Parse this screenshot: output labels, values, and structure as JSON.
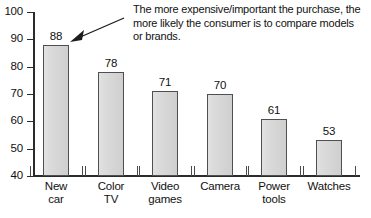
{
  "chart_data": {
    "type": "bar",
    "title": "",
    "subtitle": "",
    "xlabel": "",
    "ylabel": "",
    "ylim": [
      40,
      100
    ],
    "yticks": [
      40,
      50,
      60,
      70,
      80,
      90,
      100
    ],
    "ytick_labels": [
      "40",
      "50",
      "60",
      "70",
      "80",
      "90",
      "100"
    ],
    "grid": false,
    "legend": null,
    "categories": [
      "New car",
      "Color TV",
      "Video games",
      "Camera",
      "Power tools",
      "Watches"
    ],
    "category_lines": [
      [
        "New",
        "car"
      ],
      [
        "Color",
        "TV"
      ],
      [
        "Video",
        "games"
      ],
      [
        "Camera"
      ],
      [
        "Power",
        "tools"
      ],
      [
        "Watches"
      ]
    ],
    "values": [
      88,
      78,
      71,
      70,
      61,
      53
    ],
    "value_labels": [
      "88",
      "78",
      "71",
      "70",
      "61",
      "53"
    ],
    "annotations": [
      {
        "text": "The more expensive/important the purchase, the more likely the consumer is to compare models or brands.",
        "lines": [
          "The more expensive/important the purchase, the",
          "more likely the consumer is to compare models",
          "or brands."
        ],
        "points_to": "New car"
      }
    ],
    "colors": {
      "bar_fill": "#d9d9d9",
      "bar_border": "#4f4f4f",
      "axis": "#2b2b2b",
      "text": "#111111",
      "background": "#ffffff"
    }
  },
  "axis": {
    "y_labels": [
      "100",
      "90",
      "80",
      "70",
      "60",
      "50",
      "40"
    ]
  },
  "bars": [
    {
      "label_line1": "New",
      "label_line2": "car",
      "value": "88"
    },
    {
      "label_line1": "Color",
      "label_line2": "TV",
      "value": "78"
    },
    {
      "label_line1": "Video",
      "label_line2": "games",
      "value": "71"
    },
    {
      "label_line1": "Camera",
      "label_line2": "",
      "value": "70"
    },
    {
      "label_line1": "Power",
      "label_line2": "tools",
      "value": "61"
    },
    {
      "label_line1": "Watches",
      "label_line2": "",
      "value": "53"
    }
  ],
  "annotation": {
    "line1": "The more expensive/important the purchase, the",
    "line2": "more likely the consumer is to compare models",
    "line3": "or brands."
  }
}
